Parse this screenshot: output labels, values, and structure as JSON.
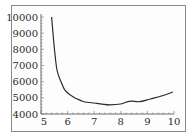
{
  "chart_data": {
    "type": "line",
    "title": "",
    "xlabel": "",
    "ylabel": "",
    "xlim": [
      5,
      10
    ],
    "ylim": [
      4000,
      10000
    ],
    "grid": false,
    "legend": null,
    "x_ticks": [
      5,
      6,
      7,
      8,
      9,
      10
    ],
    "y_ticks": [
      4000,
      5000,
      6000,
      7000,
      8000,
      9000,
      10000
    ],
    "x_tick_labels": [
      "5",
      "6",
      "7",
      "8",
      "9",
      "10"
    ],
    "y_tick_labels": [
      "4000",
      "5000",
      "6000",
      "7000",
      "8000",
      "9000",
      "10000"
    ],
    "series": [
      {
        "name": "curve",
        "color": "#2b2b2b",
        "x": [
          5.4,
          5.5,
          5.6,
          5.75,
          5.9,
          6.1,
          6.28,
          6.5,
          6.65,
          7.0,
          7.3,
          7.6,
          8.0,
          8.35,
          8.7,
          9.1,
          9.5,
          9.96
        ],
        "y": [
          10000,
          8100,
          6720,
          6000,
          5480,
          5180,
          4990,
          4830,
          4740,
          4680,
          4610,
          4570,
          4620,
          4800,
          4760,
          4930,
          5100,
          5360
        ]
      }
    ]
  }
}
